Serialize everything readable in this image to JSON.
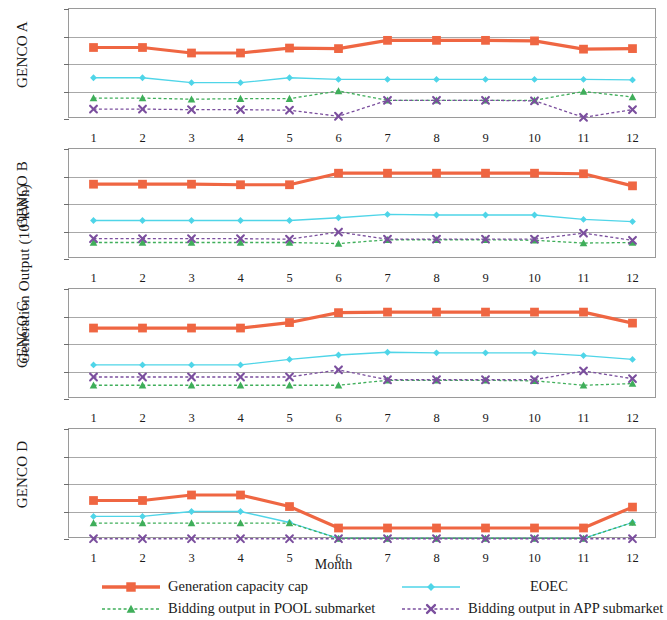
{
  "axes": {
    "ylabel_text": "Generation Output (10",
    "ylabel_sup": "4",
    "ylabel_tail": "kWh)",
    "xlabel": "Month",
    "yticks": [
      "0",
      "5",
      "10",
      "15",
      "20"
    ],
    "xticks": [
      "1",
      "2",
      "3",
      "4",
      "5",
      "6",
      "7",
      "8",
      "9",
      "10",
      "11",
      "12"
    ]
  },
  "panels": [
    {
      "name": "GENCO A"
    },
    {
      "name": "GENCO B"
    },
    {
      "name": "GENCO C"
    },
    {
      "name": "GENCO D"
    }
  ],
  "legend": {
    "items": [
      {
        "label": "Generation capacity cap",
        "color": "#ef6642",
        "marker": "square",
        "dash": "solid"
      },
      {
        "label": "EOEC",
        "color": "#4fd5e8",
        "marker": "diamond",
        "dash": "solid"
      },
      {
        "label": "Bidding output in POOL submarket",
        "color": "#3fae5a",
        "marker": "triangle",
        "dash": "dashed"
      },
      {
        "label": "Bidding output in APP submarket",
        "color": "#7b4f9e",
        "marker": "cross",
        "dash": "dashed"
      }
    ]
  },
  "chart_data": {
    "type": "line",
    "title": "",
    "xlabel": "Month",
    "ylabel": "Generation Output (10^4 kWh)",
    "x": [
      1,
      2,
      3,
      4,
      5,
      6,
      7,
      8,
      9,
      10,
      11,
      12
    ],
    "ylim": [
      0,
      20
    ],
    "yticks": [
      0,
      5,
      10,
      15,
      20
    ],
    "grid": true,
    "legend_position": "bottom",
    "subplots": [
      {
        "name": "GENCO A",
        "series": [
          {
            "name": "Generation capacity cap",
            "color": "#ef6642",
            "marker": "square",
            "dash": "solid",
            "values": [
              13.0,
              13.0,
              12.0,
              12.0,
              12.9,
              12.8,
              14.3,
              14.3,
              14.3,
              14.2,
              12.7,
              12.8
            ]
          },
          {
            "name": "EOEC",
            "color": "#4fd5e8",
            "marker": "diamond",
            "dash": "solid",
            "values": [
              7.5,
              7.5,
              6.6,
              6.6,
              7.5,
              7.2,
              7.2,
              7.2,
              7.2,
              7.2,
              7.2,
              7.1
            ]
          },
          {
            "name": "Bidding output in POOL submarket",
            "color": "#3fae5a",
            "marker": "triangle",
            "dash": "dashed",
            "values": [
              3.8,
              3.8,
              3.6,
              3.7,
              3.7,
              5.1,
              3.4,
              3.4,
              3.4,
              3.4,
              5.0,
              4.0
            ]
          },
          {
            "name": "Bidding output in APP submarket",
            "color": "#7b4f9e",
            "marker": "cross",
            "dash": "dashed",
            "values": [
              1.8,
              1.8,
              1.7,
              1.7,
              1.6,
              0.5,
              3.4,
              3.4,
              3.4,
              3.3,
              0.3,
              1.7
            ]
          }
        ]
      },
      {
        "name": "GENCO B",
        "series": [
          {
            "name": "Generation capacity cap",
            "color": "#ef6642",
            "marker": "square",
            "dash": "solid",
            "values": [
              13.6,
              13.6,
              13.6,
              13.5,
              13.5,
              15.6,
              15.6,
              15.6,
              15.6,
              15.6,
              15.5,
              13.3
            ]
          },
          {
            "name": "EOEC",
            "color": "#4fd5e8",
            "marker": "diamond",
            "dash": "solid",
            "values": [
              7.0,
              7.0,
              7.0,
              7.0,
              7.0,
              7.5,
              8.1,
              8.0,
              8.0,
              8.0,
              7.2,
              6.8
            ]
          },
          {
            "name": "Bidding output in POOL submarket",
            "color": "#3fae5a",
            "marker": "triangle",
            "dash": "dashed",
            "values": [
              3.0,
              3.0,
              3.0,
              3.0,
              3.0,
              2.8,
              3.5,
              3.5,
              3.5,
              3.4,
              2.9,
              3.0
            ]
          },
          {
            "name": "Bidding output in APP submarket",
            "color": "#7b4f9e",
            "marker": "cross",
            "dash": "dashed",
            "values": [
              3.7,
              3.7,
              3.7,
              3.7,
              3.6,
              4.9,
              3.6,
              3.6,
              3.6,
              3.6,
              4.7,
              3.4
            ]
          }
        ]
      },
      {
        "name": "GENCO C",
        "series": [
          {
            "name": "Generation capacity cap",
            "color": "#ef6642",
            "marker": "square",
            "dash": "solid",
            "values": [
              12.9,
              12.9,
              12.9,
              12.9,
              13.9,
              15.7,
              15.8,
              15.8,
              15.8,
              15.8,
              15.8,
              13.8
            ]
          },
          {
            "name": "EOEC",
            "color": "#4fd5e8",
            "marker": "diamond",
            "dash": "solid",
            "values": [
              6.2,
              6.2,
              6.2,
              6.2,
              7.2,
              8.0,
              8.5,
              8.4,
              8.4,
              8.4,
              7.9,
              7.2
            ]
          },
          {
            "name": "Bidding output in POOL submarket",
            "color": "#3fae5a",
            "marker": "triangle",
            "dash": "dashed",
            "values": [
              2.5,
              2.5,
              2.5,
              2.5,
              2.5,
              2.5,
              3.4,
              3.4,
              3.4,
              3.3,
              2.5,
              2.8
            ]
          },
          {
            "name": "Bidding output in APP submarket",
            "color": "#7b4f9e",
            "marker": "cross",
            "dash": "dashed",
            "values": [
              4.0,
              4.0,
              4.0,
              4.0,
              4.0,
              5.3,
              3.5,
              3.5,
              3.5,
              3.5,
              5.1,
              3.7
            ]
          }
        ]
      },
      {
        "name": "GENCO D",
        "series": [
          {
            "name": "Generation capacity cap",
            "color": "#ef6642",
            "marker": "square",
            "dash": "solid",
            "values": [
              7.0,
              7.0,
              8.0,
              8.0,
              5.9,
              2.0,
              2.0,
              2.0,
              2.0,
              2.0,
              2.0,
              5.8
            ]
          },
          {
            "name": "EOEC",
            "color": "#4fd5e8",
            "marker": "diamond",
            "dash": "solid",
            "values": [
              4.1,
              4.1,
              5.0,
              5.0,
              3.0,
              0.1,
              0.1,
              0.1,
              0.1,
              0.1,
              0.1,
              3.0
            ]
          },
          {
            "name": "Bidding output in POOL submarket",
            "color": "#3fae5a",
            "marker": "triangle",
            "dash": "dashed",
            "values": [
              2.9,
              2.9,
              2.9,
              2.9,
              2.9,
              0.1,
              0.1,
              0.1,
              0.1,
              0.1,
              0.1,
              3.0
            ]
          },
          {
            "name": "Bidding output in APP submarket",
            "color": "#7b4f9e",
            "marker": "cross",
            "dash": "dashed",
            "values": [
              0.05,
              0.05,
              0.05,
              0.05,
              0.05,
              0.05,
              0.05,
              0.05,
              0.05,
              0.05,
              0.05,
              0.05
            ]
          }
        ]
      }
    ]
  }
}
